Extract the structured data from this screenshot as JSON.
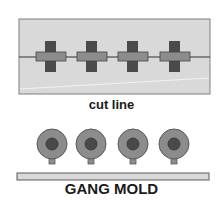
{
  "diagram": {
    "top_panel": {
      "caption": "cut line",
      "parts_count": 4,
      "colors": {
        "panel_fill": "#d9d9d9",
        "panel_border": "#808080",
        "cross_dark": "#4a4a4a",
        "cross_light": "#8c8c8c",
        "runner_line": "#333333",
        "highlight_line": "#f2f2f2"
      }
    },
    "bottom_panel": {
      "caption": "GANG MOLD",
      "parts_count": 4,
      "colors": {
        "outer_circle": "#8c8c8c",
        "inner_circle": "#4a4a4a",
        "stem": "#8c8c8c",
        "base_bar": "#d9d9d9",
        "outline": "#5a5a5a"
      }
    }
  }
}
